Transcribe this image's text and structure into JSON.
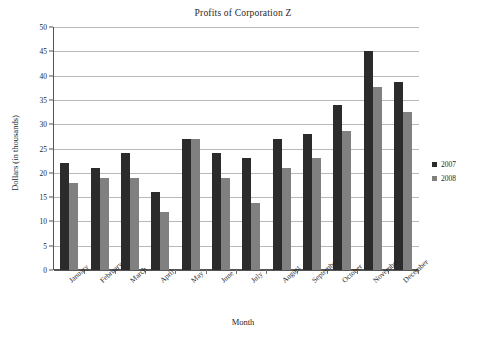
{
  "chart_data": {
    "type": "bar",
    "title": "Profits of Corporation Z",
    "xlabel": "Month",
    "ylabel": "Dollars (in thousands)",
    "categories": [
      "January",
      "February",
      "March",
      "April",
      "May",
      "June",
      "July",
      "August",
      "September",
      "October",
      "November",
      "December"
    ],
    "series": [
      {
        "name": "2007",
        "color": "#2b2b2b",
        "values": [
          22,
          21,
          24,
          16,
          27,
          24,
          23,
          27,
          28,
          34,
          45,
          38.7
        ]
      },
      {
        "name": "2008",
        "color": "#808080",
        "values": [
          18,
          19,
          19,
          12,
          27,
          19,
          13.8,
          21,
          23,
          28.7,
          37.7,
          32.6
        ]
      }
    ],
    "ylim": [
      0,
      50
    ],
    "yticks": [
      0,
      5,
      10,
      15,
      20,
      25,
      30,
      35,
      40,
      45,
      50
    ],
    "ytick_labels": [
      "0",
      "5",
      "10",
      "15",
      "20",
      "25",
      "30",
      "35",
      "40",
      "45",
      "50"
    ],
    "grid": true,
    "legend_position": "right"
  }
}
